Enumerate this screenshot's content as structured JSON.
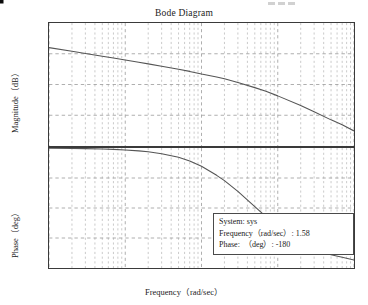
{
  "title": "Bode Diagram",
  "artifact": {
    "name": "scan-artifact",
    "dashes": 3
  },
  "axes": {
    "xlabel": "Frequency（rad/sec）",
    "magnitude": {
      "ylabel": "Magnitude（dB）",
      "ticks": [
        "100",
        "50",
        "0",
        "-50",
        "-100"
      ],
      "ylim": [
        -100,
        100
      ]
    },
    "phase": {
      "ylabel": "Phase（deg）",
      "ticks": [
        "-90",
        "-135",
        "-180",
        "-225",
        "-270"
      ],
      "ylim": [
        -270,
        -90
      ]
    },
    "xticks": [
      {
        "base": "10",
        "exp": "-2"
      },
      {
        "base": "10",
        "exp": "-1"
      },
      {
        "base": "10",
        "exp": "0"
      },
      {
        "base": "10",
        "exp": "1"
      },
      {
        "base": "10",
        "exp": "2"
      }
    ],
    "xlim": [
      0.01,
      100
    ]
  },
  "annotation": {
    "system_label": "System:",
    "system_value": "sys",
    "frequency_label": "Frequency（rad/sec）:",
    "frequency_value": "1.58",
    "phase_label": "Phase:　（deg）:",
    "phase_value": "-180"
  },
  "marker": {
    "name": "data-point-marker",
    "frequency": 1.58,
    "phase": -180
  },
  "colors": {
    "curve": "#555555",
    "grid_major": "#9a9a9a",
    "grid_minor": "#b4b4b4",
    "frame": "#3a3a3a",
    "marker": "#0b0b0b",
    "background": "#ffffff"
  },
  "chart_data": {
    "type": "line",
    "title": "Bode Diagram",
    "xlabel": "Frequency（rad/sec）",
    "xscale": "log",
    "xlim": [
      0.01,
      100
    ],
    "grid": true,
    "legend": "none",
    "subplots": [
      {
        "name": "magnitude",
        "ylabel": "Magnitude（dB）",
        "ylim": [
          -100,
          100
        ],
        "yticks": [
          100,
          50,
          0,
          -50,
          -100
        ],
        "series": [
          {
            "name": "sys",
            "x": [
              0.01,
              0.02,
              0.03,
              0.05,
              0.07,
              0.1,
              0.15,
              0.2,
              0.3,
              0.5,
              0.7,
              1.0,
              1.58,
              2.0,
              3.0,
              5.0,
              7.0,
              10.0,
              20.0,
              30.0,
              50.0,
              70.0,
              100.0
            ],
            "y": [
              60.0,
              54.0,
              50.4,
              46.0,
              43.0,
              39.9,
              36.2,
              33.5,
              29.7,
              24.7,
              21.3,
              17.0,
              12.3,
              9.4,
              3.4,
              -5.1,
              -11.1,
              -18.5,
              -34.3,
              -44.3,
              -57.5,
              -65.3,
              -75.5
            ]
          }
        ]
      },
      {
        "name": "phase",
        "ylabel": "Phase（deg）",
        "ylim": [
          -270,
          -90
        ],
        "yticks": [
          -90,
          -135,
          -180,
          -225,
          -270
        ],
        "series": [
          {
            "name": "sys",
            "x": [
              0.01,
              0.02,
              0.03,
              0.05,
              0.07,
              0.1,
              0.15,
              0.2,
              0.3,
              0.5,
              0.7,
              1.0,
              1.58,
              2.0,
              3.0,
              5.0,
              7.0,
              10.0,
              20.0,
              30.0,
              50.0,
              70.0,
              100.0
            ],
            "y": [
              -90.3,
              -90.6,
              -90.9,
              -91.4,
              -92.0,
              -92.9,
              -94.3,
              -95.7,
              -98.5,
              -104.0,
              -109.4,
              -117.5,
              -131.0,
              -139.0,
              -155.0,
              -178.0,
              -193.0,
              -208.0,
              -232.0,
              -241.0,
              -250.0,
              -254.0,
              -258.0
            ]
          }
        ],
        "annotations": [
          {
            "type": "datatip",
            "x": 1.58,
            "y": -180,
            "text": [
              "System: sys",
              "Frequency（rad/sec）: 1.58",
              "Phase:　（deg）: -180"
            ]
          }
        ]
      }
    ]
  }
}
